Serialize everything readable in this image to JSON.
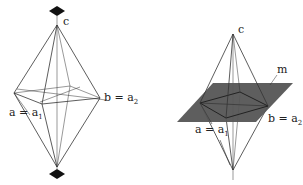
{
  "figures": [
    {
      "name": "bipyramid-with-2fold-axes",
      "labels": {
        "c": "c",
        "a_main": "a = a",
        "a_sub": "1",
        "b_main": "b = a",
        "b_sub": "2"
      }
    },
    {
      "name": "bipyramid-with-mirror-plane",
      "labels": {
        "c": "c",
        "m": "m",
        "a_main": "a = a",
        "a_sub": "1",
        "b_main": "b = a",
        "b_sub": "2"
      }
    }
  ],
  "colors": {
    "line": "#333333",
    "plane": "#555555",
    "marker": "#111111"
  }
}
